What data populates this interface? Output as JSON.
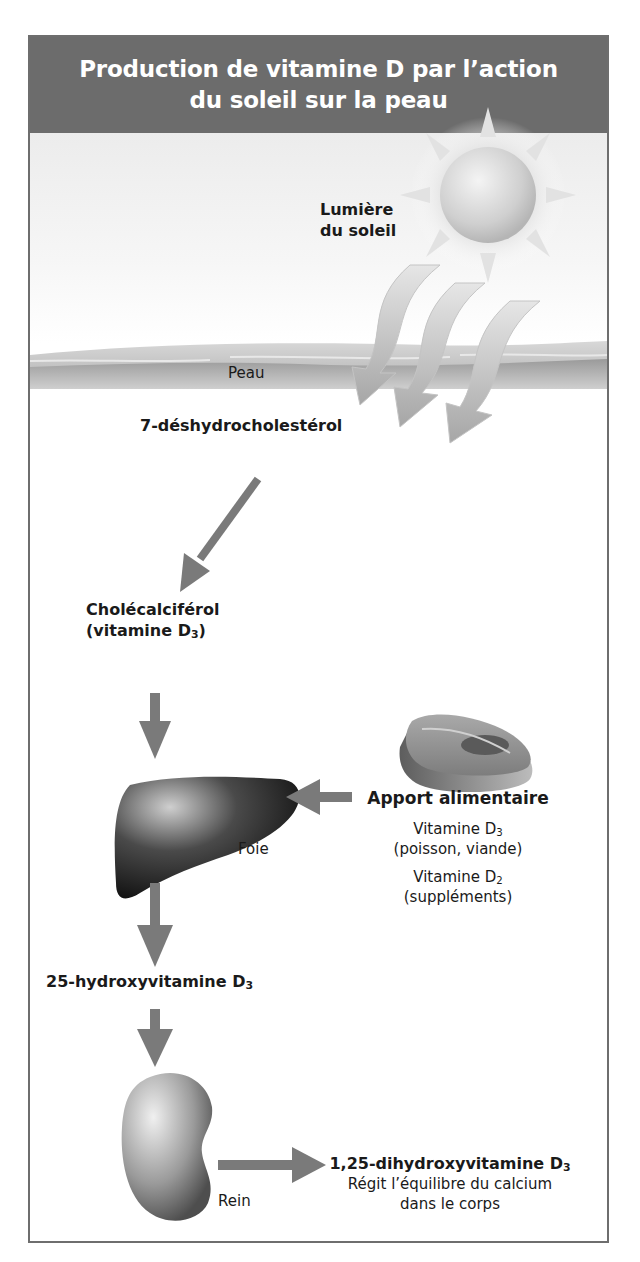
{
  "title": {
    "line1": "Production de vitamine D par l’action",
    "line2": "du soleil sur la peau"
  },
  "sun": {
    "label_line1": "Lumière",
    "label_line2": "du soleil"
  },
  "skin": {
    "label": "Peau"
  },
  "steps": {
    "precursor": "7-déshydrocholestérol",
    "cholecalciferol": "Cholécalciférol",
    "vitd3_prefix": "(vitamine D",
    "vitd3_sub": "3",
    "vitd3_suffix": ")",
    "hydroxy_prefix": "25-hydroxyvitamine D",
    "hydroxy_sub": "3",
    "dihydroxy_prefix": "1,25-dihydroxyvitamine D",
    "dihydroxy_sub": "3",
    "dihydroxy_desc_line1": "Régit l’équilibre du calcium",
    "dihydroxy_desc_line2": "dans le corps"
  },
  "organs": {
    "liver": "Foie",
    "kidney": "Rein"
  },
  "diet": {
    "heading": "Apport alimentaire",
    "d3_prefix": "Vitamine D",
    "d3_sub": "3",
    "d3_source": "(poisson, viande)",
    "d2_prefix": "Vitamine D",
    "d2_sub": "2",
    "d2_source": "(suppléments)"
  },
  "colors": {
    "header_bg": "#6c6c6c",
    "arrow": "#7a7a7a",
    "border": "#6e6e6e"
  }
}
